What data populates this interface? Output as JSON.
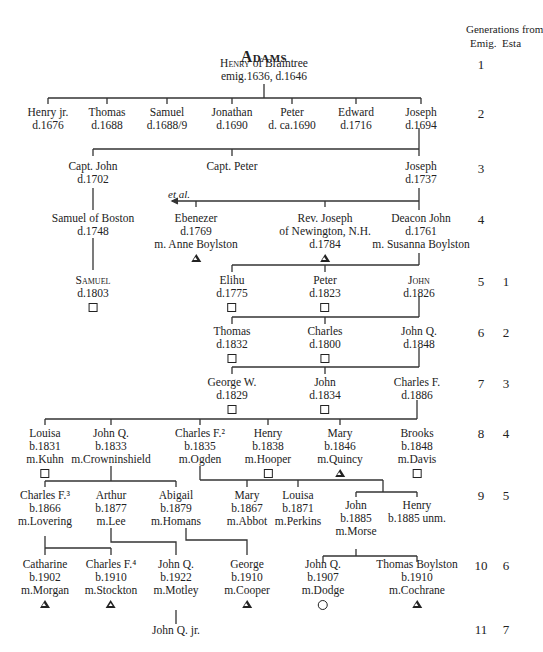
{
  "title": "Adams",
  "generations_header": {
    "line1": "Generations from",
    "col_emig": "Emig.",
    "col_esta": "Esta"
  },
  "generations": [
    {
      "emig": "1",
      "esta": ""
    },
    {
      "emig": "2",
      "esta": ""
    },
    {
      "emig": "3",
      "esta": ""
    },
    {
      "emig": "4",
      "esta": ""
    },
    {
      "emig": "5",
      "esta": "1"
    },
    {
      "emig": "6",
      "esta": "2"
    },
    {
      "emig": "7",
      "esta": "3"
    },
    {
      "emig": "8",
      "esta": "4"
    },
    {
      "emig": "9",
      "esta": "5"
    },
    {
      "emig": "10",
      "esta": "6"
    },
    {
      "emig": "11",
      "esta": "7"
    }
  ],
  "annotation": "et al.",
  "people": {
    "henry": {
      "name": "Henry",
      "name_rest": " of Braintree",
      "info": "emig.1636, d.1646"
    },
    "henry_jr": {
      "name": "Henry jr.",
      "info": "d.1676"
    },
    "thomas_g2": {
      "name": "Thomas",
      "info": "d.1688"
    },
    "samuel_g2": {
      "name": "Samuel",
      "info": "d.1688/9"
    },
    "jonathan": {
      "name": "Jonathan",
      "info": "d.1690"
    },
    "peter_g2": {
      "name": "Peter",
      "info": "d. ca.1690"
    },
    "edward": {
      "name": "Edward",
      "info": "d.1716"
    },
    "joseph_g2": {
      "name": "Joseph",
      "info": "d.1694"
    },
    "capt_john": {
      "name": "Capt. John",
      "info": "d.1702"
    },
    "capt_peter": {
      "name": "Capt. Peter"
    },
    "joseph_g3": {
      "name": "Joseph",
      "info": "d.1737"
    },
    "samuel_boston": {
      "name": "Samuel of Boston",
      "info": "d.1748"
    },
    "ebenezer": {
      "name": "Ebenezer",
      "info": "d.1769",
      "spouse": "m. Anne Boylston",
      "symbol": "triangle"
    },
    "rev_joseph": {
      "name": "Rev. Joseph",
      "info": "of Newington, N.H.",
      "info2": "d.1784",
      "symbol": "triangle"
    },
    "deacon_john": {
      "name": "Deacon John",
      "info": "d.1761",
      "spouse": "m. Susanna Boylston"
    },
    "samuel_g5": {
      "name": "Samuel",
      "info": "d.1803",
      "symbol": "square"
    },
    "elihu": {
      "name": "Elihu",
      "info": "d.1775",
      "symbol": "square"
    },
    "peter_g5": {
      "name": "Peter",
      "info": "d.1823",
      "symbol": "square"
    },
    "john_g5": {
      "name": "John",
      "info": "d.1826"
    },
    "thomas_g6": {
      "name": "Thomas",
      "info": "d.1832",
      "symbol": "square"
    },
    "charles_g6": {
      "name": "Charles",
      "info": "d.1800",
      "symbol": "square"
    },
    "john_q_g6": {
      "name": "John Q.",
      "info": "d.1848"
    },
    "george_w": {
      "name": "George W.",
      "info": "d.1829",
      "symbol": "square"
    },
    "john_g7": {
      "name": "John",
      "info": "d.1834",
      "symbol": "square"
    },
    "charles_f_g7": {
      "name": "Charles F.",
      "info": "d.1886"
    },
    "louisa_g8": {
      "name": "Louisa",
      "info": "b.1831",
      "spouse": "m.Kuhn",
      "symbol": "square"
    },
    "john_q_g8": {
      "name": "John Q.",
      "info": "b.1833",
      "spouse": "m.Crowninshield"
    },
    "charles_f2": {
      "name": "Charles F.²",
      "info": "b.1835",
      "spouse": "m.Ogden"
    },
    "henry_g8": {
      "name": "Henry",
      "info": "b.1838",
      "spouse": "m.Hooper",
      "symbol": "square"
    },
    "mary_g8": {
      "name": "Mary",
      "info": "b.1846",
      "spouse": "m.Quincy",
      "symbol": "triangle"
    },
    "brooks": {
      "name": "Brooks",
      "info": "b.1848",
      "spouse": "m.Davis",
      "symbol": "square"
    },
    "charles_f3": {
      "name": "Charles F.³",
      "info": "b.1866",
      "spouse": "m.Lovering"
    },
    "arthur": {
      "name": "Arthur",
      "info": "b.1877",
      "spouse": "m.Lee"
    },
    "abigail": {
      "name": "Abigail",
      "info": "b.1879",
      "spouse": "m.Homans"
    },
    "mary_g9": {
      "name": "Mary",
      "info": "b.1867",
      "spouse": "m.Abbot"
    },
    "louisa_g9": {
      "name": "Louisa",
      "info": "b.1871",
      "spouse": "m.Perkins"
    },
    "john_g9": {
      "name": "John",
      "info": "b.1885",
      "spouse": "m.Morse"
    },
    "henry_g9": {
      "name": "Henry",
      "info": "b.1885 unm."
    },
    "catharine": {
      "name": "Catharine",
      "info": "b.1902",
      "spouse": "m.Morgan",
      "symbol": "triangle"
    },
    "charles_f4": {
      "name": "Charles F.⁴",
      "info": "b.1910",
      "spouse": "m.Stockton",
      "symbol": "triangle"
    },
    "john_q_g10a": {
      "name": "John Q.",
      "info": "b.1922",
      "spouse": "m.Motley"
    },
    "george_g10": {
      "name": "George",
      "info": "b.1910",
      "spouse": "m.Cooper",
      "symbol": "triangle"
    },
    "john_q_g10b": {
      "name": "John Q.",
      "info": "b.1907",
      "spouse": "m.Dodge",
      "symbol": "circle"
    },
    "thomas_boylston": {
      "name": "Thomas Boylston",
      "info": "b.1910",
      "spouse": "m.Cochrane",
      "symbol": "triangle"
    },
    "john_q_jr": {
      "name": "John Q. jr."
    }
  }
}
